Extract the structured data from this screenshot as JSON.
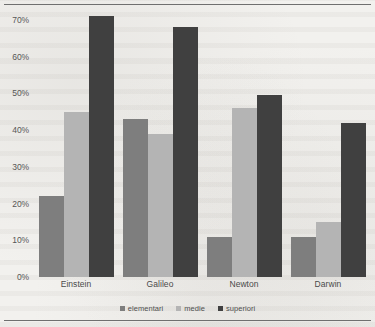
{
  "chart_data": {
    "type": "bar",
    "title": "",
    "xlabel": "",
    "ylabel": "",
    "categories": [
      "Einstein",
      "Galileo",
      "Newton",
      "Darwin"
    ],
    "series": [
      {
        "name": "elementari",
        "color": "#7e7e7e",
        "values": [
          22,
          43,
          11,
          11
        ]
      },
      {
        "name": "medie",
        "color": "#b4b4b4",
        "values": [
          45,
          39,
          46,
          15
        ]
      },
      {
        "name": "superiori",
        "color": "#404040",
        "values": [
          71,
          68,
          49.5,
          42
        ]
      }
    ],
    "ylim": [
      0,
      70
    ],
    "ytick_values": [
      0,
      10,
      20,
      30,
      40,
      50,
      60,
      70
    ],
    "ytick_labels": [
      "0%",
      "10%",
      "20%",
      "30%",
      "40%",
      "50%",
      "60%",
      "70%"
    ],
    "grid": false,
    "legend_position": "bottom",
    "value_suffix": "%"
  },
  "legend": {
    "items": [
      {
        "label": "elementari"
      },
      {
        "label": "medie"
      },
      {
        "label": "superiori"
      }
    ]
  }
}
